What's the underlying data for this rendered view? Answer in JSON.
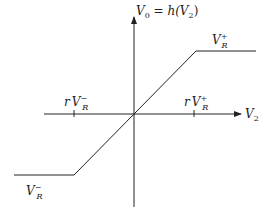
{
  "diagram": {
    "y_axis_label": {
      "main": "V",
      "sub": "0",
      "rest": " = h(V",
      "rest_sub": "2",
      "close": ")"
    },
    "x_axis_label": {
      "main": "V",
      "sub": "2"
    },
    "labels": {
      "upper_plateau": {
        "main": "V",
        "sub": "R",
        "sup": "+"
      },
      "lower_plateau": {
        "main": "V",
        "sub": "R",
        "sup": "−"
      },
      "tick_negative": {
        "prefix": "r",
        "main": "V",
        "sub": "R",
        "sup": "−"
      },
      "tick_positive": {
        "prefix": "r",
        "main": "V",
        "sub": "R",
        "sup": "+"
      }
    },
    "colors": {
      "line": "#222222",
      "background": "#ffffff"
    }
  }
}
